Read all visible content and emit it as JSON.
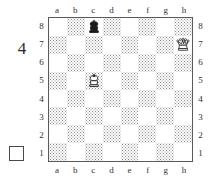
{
  "puzzle": {
    "number": "4",
    "side_to_move_indicator": "empty-white-square"
  },
  "board": {
    "files": [
      "a",
      "b",
      "c",
      "d",
      "e",
      "f",
      "g",
      "h"
    ],
    "ranks": [
      "8",
      "7",
      "6",
      "5",
      "4",
      "3",
      "2",
      "1"
    ],
    "light_square_color": "#ffffff",
    "dark_square_color": "#8e8e8e",
    "border_color": "#5a5a5a",
    "orientation": "white-bottom",
    "pieces": [
      {
        "square": "c8",
        "piece": "black-king",
        "glyph": "♚",
        "color": "black"
      },
      {
        "square": "h7",
        "piece": "white-queen",
        "glyph": "♕",
        "color": "white"
      },
      {
        "square": "c5",
        "piece": "white-king",
        "glyph": "♔",
        "color": "white"
      }
    ]
  }
}
